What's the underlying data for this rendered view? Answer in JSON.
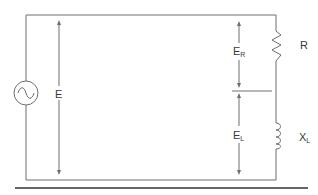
{
  "diagram": {
    "type": "series RL circuit",
    "source": {
      "symbol": "ac-source",
      "label": ""
    },
    "labels": {
      "total_voltage": "E",
      "resistor_voltage_main": "E",
      "resistor_voltage_sub": "R",
      "inductor_voltage_main": "E",
      "inductor_voltage_sub": "L",
      "resistor": "R",
      "inductor_main": "X",
      "inductor_sub": "L"
    },
    "components": [
      {
        "name": "AC source",
        "symbol": "~"
      },
      {
        "name": "Resistor",
        "label": "R"
      },
      {
        "name": "Inductor",
        "label": "XL"
      }
    ],
    "measurements": [
      {
        "label": "E",
        "spans": "total"
      },
      {
        "label": "ER",
        "spans": "resistor"
      },
      {
        "label": "EL",
        "spans": "inductor"
      }
    ],
    "colors": {
      "line": "#6e6e6e",
      "text": "#3a3a3a",
      "rule": "#333333"
    }
  }
}
